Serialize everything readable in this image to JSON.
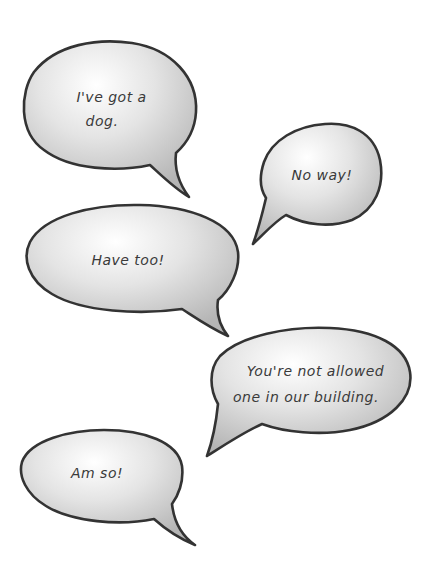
{
  "colors": {
    "background": "#ffffff",
    "bubble_outline": "#333333",
    "bubble_fill_light": "#ffffff",
    "bubble_fill_dark": "#b8b8b8",
    "text": "#3a3a3a"
  },
  "bubbles": [
    {
      "id": "bubble-1",
      "lines": [
        "I've got a",
        "dog."
      ]
    },
    {
      "id": "bubble-2",
      "lines": [
        "No way!"
      ]
    },
    {
      "id": "bubble-3",
      "lines": [
        "Have too!"
      ]
    },
    {
      "id": "bubble-4",
      "lines": [
        "You're not allowed",
        "one in our building."
      ]
    },
    {
      "id": "bubble-5",
      "lines": [
        "Am so!"
      ]
    }
  ]
}
